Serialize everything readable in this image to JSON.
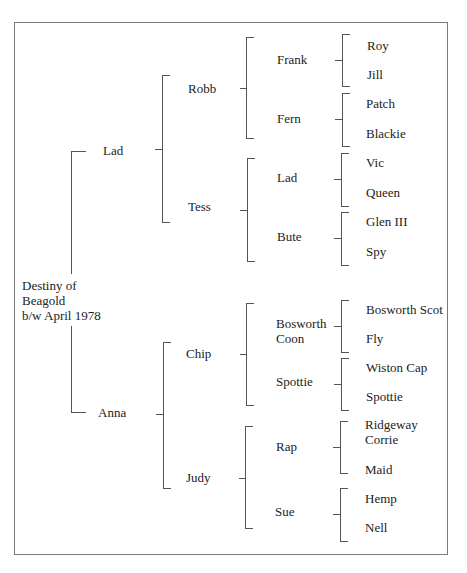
{
  "pedigree": {
    "subject": {
      "line1": "Destiny of",
      "line2": "Beagold",
      "line3": "b/w April 1978"
    },
    "gen1": {
      "sire": "Lad",
      "dam": "Anna"
    },
    "gen2": {
      "sire_sire": "Robb",
      "sire_dam": "Tess",
      "dam_sire": "Chip",
      "dam_dam": "Judy"
    },
    "gen3": {
      "robb_sire": "Frank",
      "robb_dam": "Fern",
      "tess_sire": "Lad",
      "tess_dam": "Bute",
      "chip_sire_line1": "Bosworth",
      "chip_sire_line2": "Coon",
      "chip_dam": "Spottie",
      "judy_sire": "Rap",
      "judy_dam": "Sue"
    },
    "gen4": {
      "frank_sire": "Roy",
      "frank_dam": "Jill",
      "fern_sire": "Patch",
      "fern_dam": "Blackie",
      "lad_sire": "Vic",
      "lad_dam": "Queen",
      "bute_sire": "Glen III",
      "bute_dam": "Spy",
      "bosworth_coon_sire": "Bosworth Scot",
      "bosworth_coon_dam": "Fly",
      "spottie_sire": "Wiston Cap",
      "spottie_dam": "Spottie",
      "rap_sire_line1": "Ridgeway",
      "rap_sire_line2": "Corrie",
      "rap_dam": "Maid",
      "sue_sire": "Hemp",
      "sue_dam": "Nell"
    }
  }
}
